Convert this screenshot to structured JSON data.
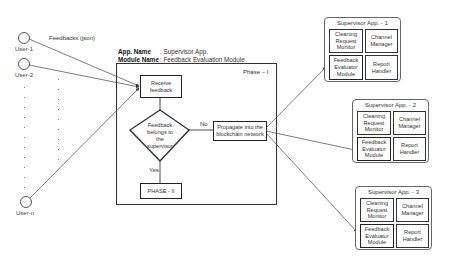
{
  "users": [
    {
      "label": "User-1"
    },
    {
      "label": "User-2"
    },
    {
      "label": "User-n"
    }
  ],
  "feedback_label": "Feedbacks (json)",
  "app_info": {
    "app_name_key": "App. Name",
    "app_name_value": ": Supervisor App.",
    "module_name_key": "Module Name",
    "module_name_value": ": Feedback Evaluation Module"
  },
  "phase1": {
    "title": "Phase – I",
    "receive": "Receive feedback",
    "decision": [
      "Feedback",
      "belongs to",
      "the",
      "supervisor"
    ],
    "no_label": "No",
    "yes_label": "Yes",
    "propagate": "Propagate into the blockchain network",
    "phase2": "PHASE - II"
  },
  "supervisor_apps": [
    {
      "title": "Supervisor App. - 1",
      "modules": [
        "Cleaning Request Monitor",
        "Channel Manager",
        "Feedback Evaluator Module",
        "Report Handler"
      ]
    },
    {
      "title": "Supervisor App. - 2",
      "modules": [
        "Cleaning Request Monitor",
        "Channel Manager",
        "Feedback Evaluator Module",
        "Report Handler"
      ]
    },
    {
      "title": "Supervisor App. - 3",
      "modules": [
        "Cleaning Request Monitor",
        "Channel Manager",
        "Feedback Evaluator Module",
        "Report Handler"
      ]
    }
  ]
}
